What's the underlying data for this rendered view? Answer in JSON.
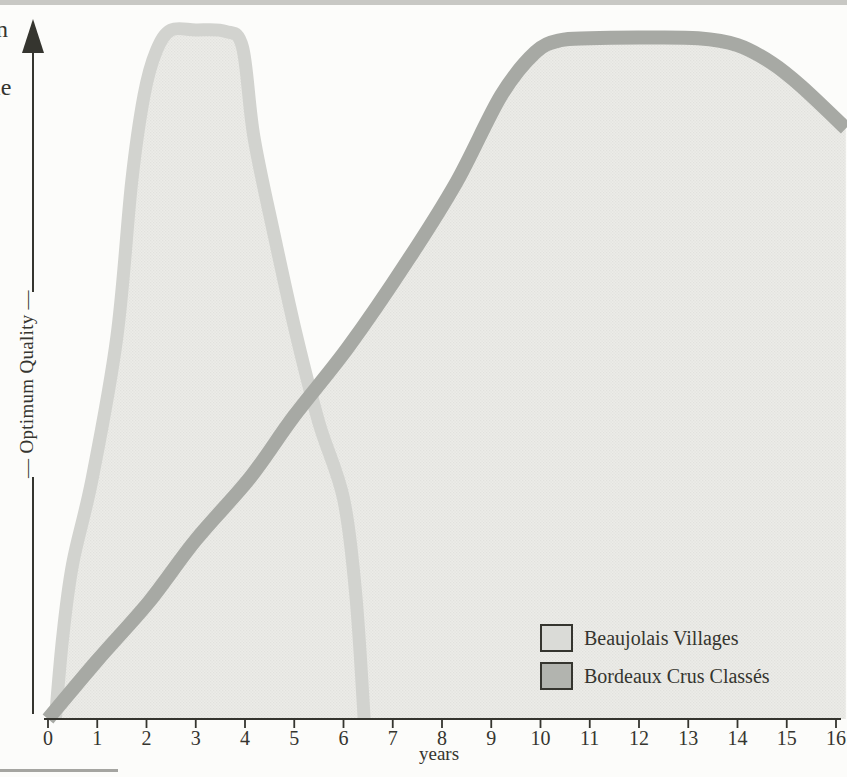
{
  "theme": {
    "paper": "#fcfcfa",
    "ink": "#35352f",
    "strip": "#c8c8c4",
    "rule": "#a5a5a1",
    "chart-fill": "#ecece8",
    "chart-fill-dot": "#e1e1dd"
  },
  "edge_fragments": {
    "top": "n",
    "bottom": "ie"
  },
  "chart_data": {
    "type": "area",
    "title": "",
    "xlabel": "years",
    "ylabel": "Optimum Quality",
    "ylabel_display": "— Optimum Quality —",
    "xlim": [
      0,
      16
    ],
    "ylim_relative": [
      0,
      1
    ],
    "x_ticks": [
      "0",
      "1",
      "2",
      "3",
      "4",
      "5",
      "6",
      "7",
      "8",
      "9",
      "10",
      "11",
      "12",
      "13",
      "14",
      "15",
      "16"
    ],
    "grid": "off",
    "y_axis_style": "arrow pointing up, no numeric scale",
    "legend_position": "bottom-right",
    "series": [
      {
        "id": "beaujolais-villages",
        "name": "Beaujolais Villages",
        "band_color": "#d2d3cf",
        "band_width": 13,
        "fill_color": "#ecece8",
        "points": [
          [
            0.15,
            0.0
          ],
          [
            0.3,
            0.12
          ],
          [
            0.5,
            0.225
          ],
          [
            0.9,
            0.35
          ],
          [
            1.4,
            0.555
          ],
          [
            1.7,
            0.78
          ],
          [
            1.95,
            0.905
          ],
          [
            2.2,
            0.97
          ],
          [
            2.5,
            1.0
          ],
          [
            3.0,
            1.0
          ],
          [
            3.6,
            0.998
          ],
          [
            3.95,
            0.975
          ],
          [
            4.18,
            0.845
          ],
          [
            4.6,
            0.7
          ],
          [
            5.05,
            0.555
          ],
          [
            5.5,
            0.43
          ],
          [
            6.0,
            0.32
          ],
          [
            6.25,
            0.18
          ],
          [
            6.42,
            0.0
          ]
        ]
      },
      {
        "id": "bordeaux-crus-classes",
        "name": "Bordeaux Crus Classés",
        "band_color": "#a7a9a4",
        "band_width": 14,
        "fill_color": "#ecece8",
        "points": [
          [
            0.0,
            0.0
          ],
          [
            1.0,
            0.085
          ],
          [
            2.05,
            0.17
          ],
          [
            3.0,
            0.26
          ],
          [
            4.1,
            0.35
          ],
          [
            5.0,
            0.44
          ],
          [
            6.1,
            0.54
          ],
          [
            7.3,
            0.665
          ],
          [
            8.3,
            0.78
          ],
          [
            9.2,
            0.905
          ],
          [
            9.9,
            0.968
          ],
          [
            10.4,
            0.985
          ],
          [
            11.0,
            0.988
          ],
          [
            12.0,
            0.989
          ],
          [
            13.2,
            0.988
          ],
          [
            14.0,
            0.978
          ],
          [
            14.7,
            0.952
          ],
          [
            15.3,
            0.918
          ],
          [
            16.2,
            0.857
          ]
        ]
      }
    ]
  },
  "legend": {
    "items": [
      {
        "swatch_color": "#dadbd7"
      },
      {
        "swatch_color": "#b2b4af"
      }
    ]
  }
}
